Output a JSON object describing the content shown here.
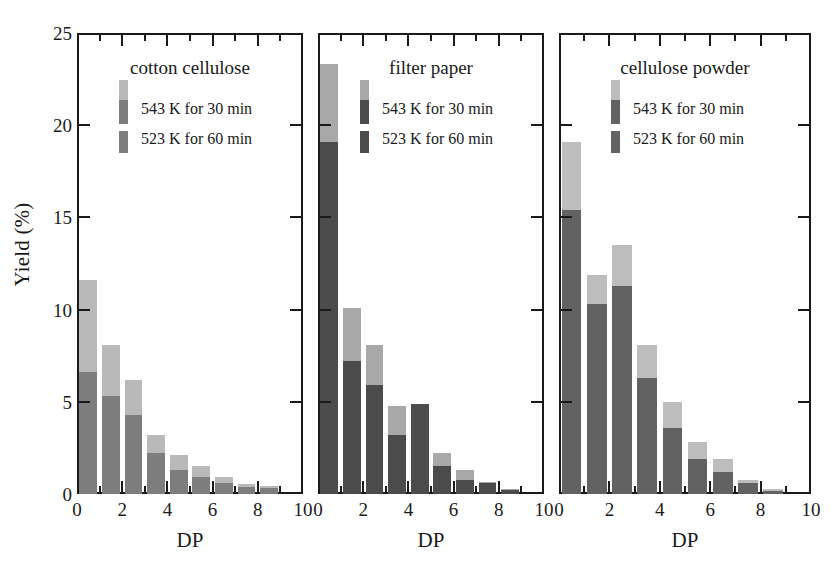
{
  "figure": {
    "ylabel": "Yield (%)",
    "xlabel": "DP",
    "y_ticks": [
      0,
      5,
      10,
      15,
      20,
      25
    ],
    "x_ticks": [
      0,
      2,
      4,
      6,
      8,
      10
    ],
    "ylim": [
      0,
      25
    ],
    "xlim": [
      0,
      10
    ],
    "legend_labels": {
      "series_a": "543 K for 30 min",
      "series_b": "523 K for 60 min"
    },
    "colors": {
      "light_gray": "#b9b9b9",
      "mid_gray": "#7d7d7d",
      "dark_gray": "#4b4b4b",
      "axis": "#1a1a1a"
    }
  },
  "chart_data": [
    {
      "type": "bar",
      "title": "cotton cellulose",
      "xlabel": "DP",
      "ylabel": "Yield (%)",
      "xlim": [
        0,
        10
      ],
      "ylim": [
        0,
        25
      ],
      "grid": false,
      "legend_position": "upper-left-inside",
      "stacked": true,
      "categories": [
        1,
        2,
        3,
        4,
        5,
        6,
        7,
        8,
        9
      ],
      "series": [
        {
          "name": "523 K for 60 min",
          "color": "#7d7d7d",
          "values": [
            6.6,
            5.3,
            4.3,
            2.2,
            1.3,
            0.9,
            0.6,
            0.4,
            0.35
          ]
        },
        {
          "name": "543 K for 30 min",
          "color": "#b9b9b9",
          "values": [
            5.0,
            2.8,
            1.9,
            1.0,
            0.8,
            0.6,
            0.3,
            0.15,
            0.1
          ]
        }
      ],
      "totals": [
        11.6,
        8.1,
        6.2,
        3.2,
        2.1,
        1.5,
        0.9,
        0.55,
        0.45
      ]
    },
    {
      "type": "bar",
      "title": "filter paper",
      "xlabel": "DP",
      "ylabel": "Yield (%)",
      "xlim": [
        0,
        10
      ],
      "ylim": [
        0,
        25
      ],
      "grid": false,
      "legend_position": "upper-left-inside",
      "stacked": true,
      "categories": [
        1,
        2,
        3,
        4,
        5,
        6,
        7,
        8,
        9
      ],
      "series": [
        {
          "name": "523 K for 60 min",
          "color": "#4b4b4b",
          "values": [
            19.1,
            7.2,
            5.9,
            3.2,
            4.9,
            1.5,
            0.75,
            0.6,
            0.2
          ]
        },
        {
          "name": "543 K for 30 min",
          "color": "#a8a8a8",
          "values": [
            4.2,
            2.9,
            2.2,
            1.55,
            0.0,
            0.7,
            0.55,
            0.05,
            0.05
          ]
        }
      ],
      "totals": [
        23.3,
        10.1,
        8.1,
        4.75,
        4.9,
        2.2,
        1.3,
        0.65,
        0.25
      ]
    },
    {
      "type": "bar",
      "title": "cellulose powder",
      "xlabel": "DP",
      "ylabel": "Yield (%)",
      "xlim": [
        0,
        10
      ],
      "ylim": [
        0,
        25
      ],
      "grid": false,
      "legend_position": "upper-left-inside",
      "stacked": true,
      "categories": [
        1,
        2,
        3,
        4,
        5,
        6,
        7,
        8,
        9
      ],
      "series": [
        {
          "name": "523 K for 60 min",
          "color": "#626262",
          "values": [
            15.4,
            10.3,
            11.3,
            6.3,
            3.6,
            1.9,
            1.2,
            0.6,
            0.15
          ]
        },
        {
          "name": "543 K for 30 min",
          "color": "#bdbdbd",
          "values": [
            3.7,
            1.6,
            2.2,
            1.8,
            1.4,
            0.9,
            0.7,
            0.15,
            0.1
          ]
        }
      ],
      "totals": [
        19.1,
        11.9,
        13.5,
        8.1,
        5.0,
        2.8,
        1.9,
        0.75,
        0.25
      ]
    }
  ]
}
